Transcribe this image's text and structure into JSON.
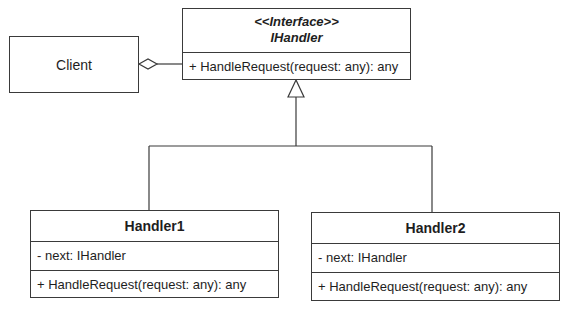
{
  "diagram": {
    "type": "UML class diagram",
    "interface": {
      "stereotype": "<<Interface>>",
      "name": "IHandler",
      "methods": [
        "+ HandleRequest(request: any): any"
      ]
    },
    "client": {
      "name": "Client"
    },
    "handler1": {
      "name": "Handler1",
      "attributes": [
        "- next: IHandler"
      ],
      "methods": [
        "+ HandleRequest(request: any): any"
      ]
    },
    "handler2": {
      "name": "Handler2",
      "attributes": [
        "- next: IHandler"
      ],
      "methods": [
        "+ HandleRequest(request: any): any"
      ]
    },
    "relationships": [
      {
        "from": "Client",
        "to": "IHandler",
        "kind": "aggregation"
      },
      {
        "from": "Handler1",
        "to": "IHandler",
        "kind": "realization"
      },
      {
        "from": "Handler2",
        "to": "IHandler",
        "kind": "realization"
      }
    ],
    "colors": {
      "line": "#3a3a3a",
      "background": "#ffffff",
      "text": "#1e1e1e"
    }
  }
}
